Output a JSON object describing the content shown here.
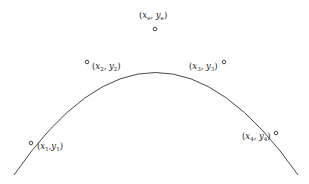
{
  "diagram": {
    "type": "parabola-with-points",
    "curve_color": "#333333",
    "points": [
      {
        "id": "p1",
        "var_x": "x",
        "sub_x": "1",
        "var_y": "y",
        "sub_y": "1",
        "sep": ","
      },
      {
        "id": "p2",
        "var_x": "x",
        "sub_x": "2",
        "var_y": "y",
        "sub_y": "2",
        "sep": ", "
      },
      {
        "id": "pe",
        "var_x": "x",
        "sub_x": "e",
        "var_y": "y",
        "sub_y": "e",
        "sep": ", "
      },
      {
        "id": "p3",
        "var_x": "x",
        "sub_x": "3",
        "var_y": "y",
        "sub_y": "3",
        "sep": ", "
      },
      {
        "id": "p4",
        "var_x": "x",
        "sub_x": "4",
        "var_y": "y",
        "sub_y": "4",
        "sep": ", "
      }
    ]
  }
}
